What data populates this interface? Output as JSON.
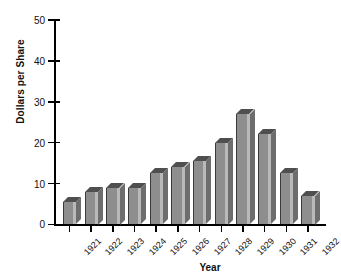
{
  "chart_data": {
    "type": "bar",
    "title": "",
    "xlabel": "Year",
    "ylabel": "Dollars per Share",
    "categories": [
      "1921",
      "1922",
      "1923",
      "1924",
      "1925",
      "1926",
      "1927",
      "1928",
      "1929",
      "1930",
      "1931",
      "1932"
    ],
    "values": [
      5.5,
      8,
      9,
      8.8,
      12.5,
      14,
      15.5,
      20,
      27,
      22,
      12.5,
      7
    ],
    "ylim": [
      0,
      50
    ],
    "yticks": [
      0,
      10,
      20,
      30,
      40,
      50
    ],
    "ytick_labels": [
      "0",
      "10",
      "20",
      "30",
      "40",
      "50"
    ],
    "grid": false,
    "legend": false,
    "bar_style": "3d-extruded",
    "colors": {
      "bar_face": "#8e8e8e",
      "bar_top": "#4f4f4f",
      "bar_side": "#6d6d6d",
      "bar_highlight": "#b9b9b9",
      "axis": "#000000",
      "text": "#111111",
      "background": "#ffffff"
    }
  }
}
